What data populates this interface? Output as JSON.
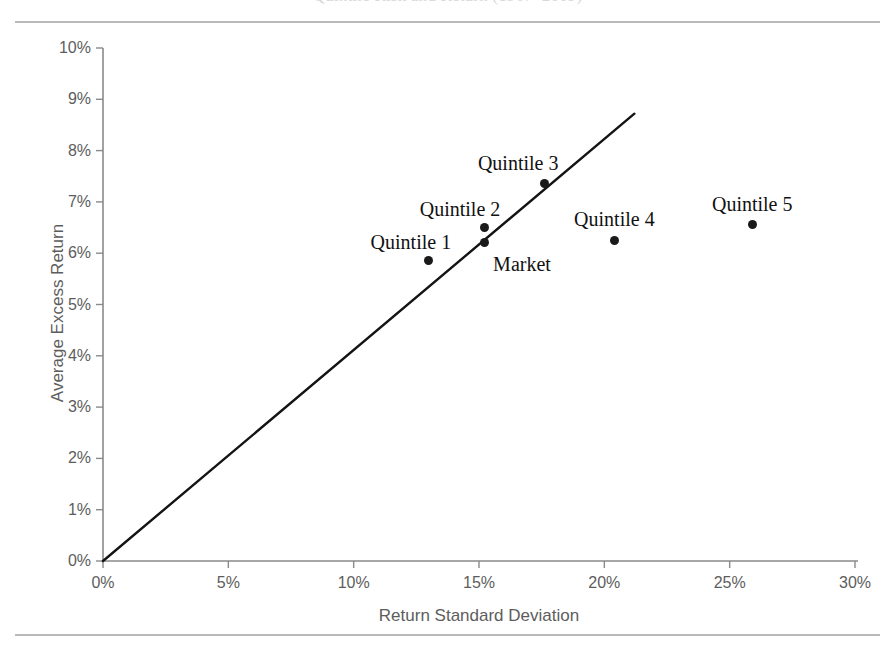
{
  "figure": {
    "title": "Quintile Risk and Return (1967–2009)"
  },
  "chart_data": {
    "type": "scatter",
    "title": "Quintile Risk and Return (1967–2009)",
    "xlabel": "Return Standard Deviation",
    "ylabel": "Average Excess Return",
    "xlim": [
      0,
      30
    ],
    "ylim": [
      0,
      10
    ],
    "x_unit": "%",
    "y_unit": "%",
    "xticks": [
      "0%",
      "5%",
      "10%",
      "15%",
      "20%",
      "25%",
      "30%"
    ],
    "xtick_values": [
      0,
      5,
      10,
      15,
      20,
      25,
      30
    ],
    "yticks": [
      "0%",
      "1%",
      "2%",
      "3%",
      "4%",
      "5%",
      "6%",
      "7%",
      "8%",
      "9%",
      "10%"
    ],
    "ytick_values": [
      0,
      1,
      2,
      3,
      4,
      5,
      6,
      7,
      8,
      9,
      10
    ],
    "grid": false,
    "legend": "none",
    "points": [
      {
        "label": "Quintile 1",
        "x": 13.0,
        "y": 5.85,
        "label_dx": -18,
        "label_dy": -16
      },
      {
        "label": "Quintile 2",
        "x": 15.2,
        "y": 6.5,
        "label_dx": -24,
        "label_dy": -16
      },
      {
        "label": "Market",
        "x": 15.2,
        "y": 6.2,
        "label_dx": 38,
        "label_dy": 24
      },
      {
        "label": "Quintile 3",
        "x": 17.6,
        "y": 7.35,
        "label_dx": -26,
        "label_dy": -18
      },
      {
        "label": "Quintile 4",
        "x": 20.4,
        "y": 6.25,
        "label_dx": 0,
        "label_dy": -18
      },
      {
        "label": "Quintile 5",
        "x": 25.9,
        "y": 6.55,
        "label_dx": 0,
        "label_dy": -18
      }
    ],
    "reference_line": {
      "name": "capital-market-line",
      "from": [
        0,
        0
      ],
      "to": [
        21.2,
        8.72
      ],
      "color": "#141414"
    },
    "axis_color": "#808080",
    "marker_color": "#1a1a1a"
  }
}
